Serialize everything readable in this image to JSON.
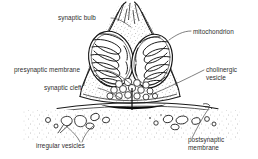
{
  "figure": {
    "background_color": "#ffffff",
    "ink_color": "#1a1a1a",
    "text_color": "#2e2e2e",
    "width": 258,
    "height": 159
  },
  "labels": {
    "synaptic_bulb": "synaptic bulb",
    "mitochondrion": "mitochondrion",
    "presynaptic_membrane": "presynaptic membrane",
    "cholinergic_vesicle_line1": "cholinergic",
    "cholinergic_vesicle_line2": "vesicle",
    "synaptic_cleft": "synaptic cleft",
    "irregular_vesicles": "irregular vesicles",
    "postsynaptic_membrane_line1": "postsynaptic",
    "postsynaptic_membrane_line2": "membrane"
  },
  "structures": {
    "synaptic_bulb": "presynaptic terminal bulb with tapering neck at top",
    "mitochondria_count": 2,
    "cholinergic_vesicles_count": 14,
    "irregular_vesicles_count": 13,
    "synaptic_cleft": "dark band between presynaptic and postsynaptic membranes",
    "transmission_arrow": "downward arrow crossing the synaptic cleft"
  }
}
